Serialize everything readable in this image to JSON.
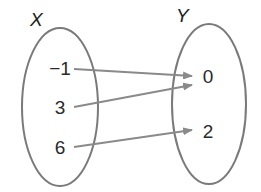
{
  "diagram": {
    "type": "mapping-diagram",
    "domain_set": {
      "label": "X",
      "elements": [
        "−1",
        "3",
        "6"
      ]
    },
    "codomain_set": {
      "label": "Y",
      "elements": [
        "0",
        "2"
      ]
    },
    "mappings": [
      {
        "from": "−1",
        "to": "0"
      },
      {
        "from": "3",
        "to": "0"
      },
      {
        "from": "6",
        "to": "2"
      }
    ],
    "colors": {
      "ellipse": "#7a7a7a",
      "arrow": "#8a8a8a",
      "text": "#2a2a2a"
    }
  }
}
